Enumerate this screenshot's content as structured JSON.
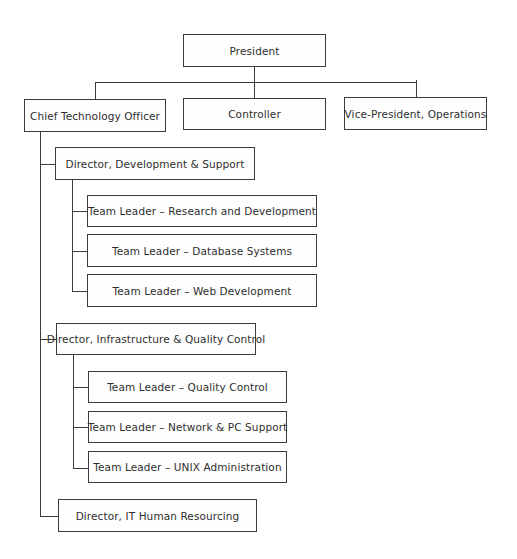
{
  "org_chart": {
    "root": {
      "label": "President"
    },
    "level1": [
      {
        "label": "Chief Technology Officer"
      },
      {
        "label": "Controller"
      },
      {
        "label": "Vice-President, Operations"
      }
    ],
    "cto_directors": [
      {
        "label": "Director, Development & Support",
        "team_leaders": [
          {
            "label": "Team Leader – Research and Development"
          },
          {
            "label": "Team Leader – Database Systems"
          },
          {
            "label": "Team Leader – Web Development"
          }
        ]
      },
      {
        "label": "Director, Infrastructure & Quality Control",
        "team_leaders": [
          {
            "label": "Team Leader – Quality Control"
          },
          {
            "label": "Team Leader – Network & PC Support"
          },
          {
            "label": "Team Leader – UNIX Administration"
          }
        ]
      },
      {
        "label": "Director, IT Human Resourcing",
        "team_leaders": []
      }
    ],
    "colors": {
      "border": "#3c3c3c",
      "text": "#2e2e2e",
      "background": "#ffffff"
    }
  }
}
